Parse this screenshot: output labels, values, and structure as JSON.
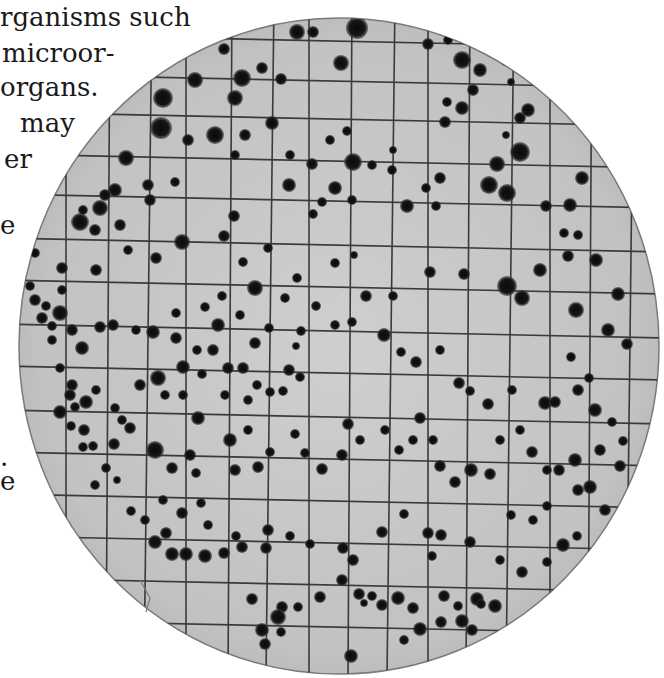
{
  "text_fragments": [
    {
      "text": "rganisms such",
      "x": 0,
      "y": 4
    },
    {
      "text": "microor-",
      "x": 2,
      "y": 40
    },
    {
      "text": "organs.",
      "x": 0,
      "y": 74
    },
    {
      "text": "may",
      "x": 20,
      "y": 110
    },
    {
      "text": "er",
      "x": 4,
      "y": 146
    },
    {
      "text": "e",
      "x": 0,
      "y": 212
    },
    {
      "text": ".",
      "x": 0,
      "y": 444
    },
    {
      "text": "e",
      "x": 0,
      "y": 468
    }
  ],
  "plate": {
    "cx": 339,
    "cy": 346,
    "rx": 320,
    "ry": 328,
    "fill": "#c4c4c4",
    "rim": "#7a7a7a",
    "grid_color": "#3a3a3a",
    "colony_color": "#111111",
    "grid_x": [
      68,
      110,
      150,
      188,
      232,
      272,
      311,
      352,
      393,
      430,
      470,
      512,
      552,
      592,
      632
    ],
    "grid_y": [
      40,
      80,
      118,
      160,
      200,
      244,
      286,
      330,
      372,
      416,
      458,
      500,
      542,
      584,
      626
    ]
  },
  "colonies": [
    [
      357,
      28,
      11
    ],
    [
      297,
      32,
      8
    ],
    [
      313,
      32,
      6
    ],
    [
      242,
      78,
      9
    ],
    [
      341,
      63,
      8
    ],
    [
      195,
      80,
      8
    ],
    [
      235,
      98,
      8
    ],
    [
      281,
      79,
      6
    ],
    [
      272,
      123,
      7
    ],
    [
      245,
      135,
      6
    ],
    [
      215,
      135,
      9
    ],
    [
      188,
      140,
      6
    ],
    [
      235,
      155,
      5
    ],
    [
      161,
      128,
      11
    ],
    [
      163,
      98,
      10
    ],
    [
      224,
      49,
      6
    ],
    [
      262,
      68,
      6
    ],
    [
      80,
      222,
      9
    ],
    [
      100,
      208,
      8
    ],
    [
      95,
      230,
      6
    ],
    [
      115,
      190,
      7
    ],
    [
      120,
      225,
      6
    ],
    [
      126,
      158,
      8
    ],
    [
      105,
      195,
      6
    ],
    [
      150,
      200,
      6
    ],
    [
      175,
      182,
      5
    ],
    [
      148,
      185,
      6
    ],
    [
      83,
      210,
      5
    ],
    [
      428,
      44,
      6
    ],
    [
      448,
      40,
      5
    ],
    [
      477,
      35,
      8
    ],
    [
      462,
      60,
      9
    ],
    [
      480,
      70,
      7
    ],
    [
      473,
      90,
      6
    ],
    [
      447,
      102,
      5
    ],
    [
      462,
      108,
      7
    ],
    [
      445,
      122,
      6
    ],
    [
      506,
      60,
      6
    ],
    [
      511,
      82,
      4
    ],
    [
      520,
      118,
      6
    ],
    [
      520,
      152,
      10
    ],
    [
      497,
      164,
      8
    ],
    [
      507,
      193,
      9
    ],
    [
      546,
      206,
      6
    ],
    [
      582,
      178,
      7
    ],
    [
      570,
      205,
      7
    ],
    [
      578,
      235,
      5
    ],
    [
      564,
      233,
      5
    ],
    [
      489,
      185,
      9
    ],
    [
      528,
      110,
      7
    ],
    [
      506,
      135,
      4
    ],
    [
      353,
      162,
      9
    ],
    [
      347,
      131,
      5
    ],
    [
      330,
      140,
      5
    ],
    [
      312,
      164,
      6
    ],
    [
      335,
      188,
      7
    ],
    [
      352,
      200,
      5
    ],
    [
      322,
      202,
      5
    ],
    [
      372,
      165,
      5
    ],
    [
      290,
      155,
      5
    ],
    [
      289,
      185,
      7
    ],
    [
      313,
      214,
      5
    ],
    [
      407,
      206,
      7
    ],
    [
      392,
      170,
      5
    ],
    [
      393,
      150,
      4
    ],
    [
      426,
      188,
      5
    ],
    [
      440,
      178,
      6
    ],
    [
      436,
      206,
      5
    ],
    [
      234,
      216,
      6
    ],
    [
      224,
      236,
      6
    ],
    [
      243,
      262,
      5
    ],
    [
      268,
      248,
      5
    ],
    [
      182,
      242,
      8
    ],
    [
      156,
      258,
      6
    ],
    [
      128,
      250,
      5
    ],
    [
      96,
      270,
      6
    ],
    [
      62,
      268,
      6
    ],
    [
      35,
      253,
      5
    ],
    [
      255,
      288,
      8
    ],
    [
      285,
      298,
      5
    ],
    [
      297,
      278,
      5
    ],
    [
      335,
      263,
      5
    ],
    [
      354,
      255,
      4
    ],
    [
      366,
      296,
      6
    ],
    [
      393,
      296,
      5
    ],
    [
      430,
      272,
      6
    ],
    [
      464,
      274,
      6
    ],
    [
      507,
      286,
      10
    ],
    [
      522,
      298,
      8
    ],
    [
      540,
      270,
      7
    ],
    [
      568,
      256,
      6
    ],
    [
      596,
      260,
      7
    ],
    [
      576,
      310,
      8
    ],
    [
      608,
      330,
      7
    ],
    [
      618,
      294,
      7
    ],
    [
      627,
      344,
      6
    ],
    [
      62,
      290,
      5
    ],
    [
      60,
      313,
      8
    ],
    [
      72,
      330,
      6
    ],
    [
      52,
      340,
      5
    ],
    [
      82,
      348,
      7
    ],
    [
      100,
      327,
      6
    ],
    [
      113,
      325,
      6
    ],
    [
      136,
      330,
      5
    ],
    [
      153,
      332,
      7
    ],
    [
      176,
      313,
      5
    ],
    [
      176,
      338,
      6
    ],
    [
      218,
      325,
      7
    ],
    [
      240,
      315,
      5
    ],
    [
      255,
      343,
      6
    ],
    [
      269,
      328,
      5
    ],
    [
      296,
      346,
      4
    ],
    [
      301,
      331,
      5
    ],
    [
      316,
      306,
      5
    ],
    [
      335,
      325,
      5
    ],
    [
      352,
      322,
      5
    ],
    [
      205,
      307,
      5
    ],
    [
      222,
      296,
      5
    ],
    [
      213,
      350,
      6
    ],
    [
      197,
      350,
      5
    ],
    [
      183,
      367,
      7
    ],
    [
      202,
      374,
      5
    ],
    [
      228,
      368,
      6
    ],
    [
      243,
      368,
      6
    ],
    [
      257,
      385,
      5
    ],
    [
      248,
      400,
      5
    ],
    [
      270,
      392,
      5
    ],
    [
      283,
      391,
      5
    ],
    [
      289,
      370,
      6
    ],
    [
      300,
      377,
      5
    ],
    [
      384,
      335,
      7
    ],
    [
      401,
      352,
      5
    ],
    [
      416,
      362,
      6
    ],
    [
      440,
      350,
      5
    ],
    [
      459,
      383,
      6
    ],
    [
      470,
      391,
      5
    ],
    [
      488,
      404,
      6
    ],
    [
      512,
      390,
      5
    ],
    [
      545,
      403,
      7
    ],
    [
      555,
      402,
      6
    ],
    [
      578,
      390,
      6
    ],
    [
      595,
      410,
      7
    ],
    [
      589,
      378,
      5
    ],
    [
      571,
      357,
      5
    ],
    [
      60,
      368,
      5
    ],
    [
      70,
      395,
      6
    ],
    [
      60,
      412,
      7
    ],
    [
      86,
      402,
      7
    ],
    [
      96,
      390,
      5
    ],
    [
      115,
      408,
      5
    ],
    [
      122,
      420,
      5
    ],
    [
      140,
      385,
      6
    ],
    [
      158,
      378,
      8
    ],
    [
      165,
      395,
      5
    ],
    [
      183,
      395,
      5
    ],
    [
      198,
      418,
      7
    ],
    [
      225,
      395,
      5
    ],
    [
      230,
      440,
      7
    ],
    [
      248,
      430,
      5
    ],
    [
      84,
      430,
      6
    ],
    [
      93,
      446,
      5
    ],
    [
      114,
      444,
      6
    ],
    [
      130,
      428,
      6
    ],
    [
      155,
      450,
      9
    ],
    [
      172,
      468,
      6
    ],
    [
      190,
      455,
      6
    ],
    [
      196,
      473,
      5
    ],
    [
      235,
      470,
      6
    ],
    [
      258,
      467,
      6
    ],
    [
      270,
      452,
      5
    ],
    [
      295,
      434,
      5
    ],
    [
      305,
      453,
      5
    ],
    [
      322,
      469,
      6
    ],
    [
      342,
      455,
      6
    ],
    [
      348,
      424,
      6
    ],
    [
      360,
      440,
      5
    ],
    [
      385,
      430,
      5
    ],
    [
      399,
      450,
      5
    ],
    [
      420,
      418,
      6
    ],
    [
      413,
      440,
      5
    ],
    [
      433,
      440,
      5
    ],
    [
      440,
      466,
      6
    ],
    [
      455,
      482,
      6
    ],
    [
      471,
      470,
      7
    ],
    [
      490,
      474,
      6
    ],
    [
      500,
      440,
      5
    ],
    [
      520,
      430,
      5
    ],
    [
      532,
      452,
      6
    ],
    [
      547,
      470,
      5
    ],
    [
      559,
      470,
      6
    ],
    [
      575,
      460,
      7
    ],
    [
      590,
      487,
      7
    ],
    [
      600,
      450,
      6
    ],
    [
      620,
      466,
      6
    ],
    [
      623,
      441,
      5
    ],
    [
      612,
      422,
      5
    ],
    [
      155,
      542,
      7
    ],
    [
      166,
      533,
      6
    ],
    [
      172,
      554,
      7
    ],
    [
      186,
      554,
      7
    ],
    [
      205,
      556,
      7
    ],
    [
      224,
      553,
      6
    ],
    [
      242,
      547,
      6
    ],
    [
      266,
      548,
      6
    ],
    [
      236,
      536,
      5
    ],
    [
      268,
      530,
      6
    ],
    [
      290,
      536,
      5
    ],
    [
      310,
      544,
      5
    ],
    [
      343,
      548,
      6
    ],
    [
      353,
      560,
      6
    ],
    [
      382,
      532,
      6
    ],
    [
      404,
      514,
      5
    ],
    [
      428,
      533,
      6
    ],
    [
      441,
      535,
      6
    ],
    [
      432,
      556,
      5
    ],
    [
      470,
      542,
      6
    ],
    [
      252,
      599,
      6
    ],
    [
      282,
      607,
      6
    ],
    [
      278,
      617,
      8
    ],
    [
      262,
      630,
      7
    ],
    [
      265,
      644,
      6
    ],
    [
      281,
      632,
      5
    ],
    [
      298,
      607,
      5
    ],
    [
      320,
      597,
      6
    ],
    [
      342,
      580,
      6
    ],
    [
      359,
      594,
      6
    ],
    [
      372,
      596,
      5
    ],
    [
      382,
      605,
      6
    ],
    [
      398,
      598,
      7
    ],
    [
      413,
      608,
      6
    ],
    [
      404,
      640,
      5
    ],
    [
      420,
      629,
      7
    ],
    [
      444,
      596,
      6
    ],
    [
      441,
      622,
      6
    ],
    [
      458,
      606,
      5
    ],
    [
      462,
      621,
      7
    ],
    [
      472,
      630,
      6
    ],
    [
      477,
      599,
      7
    ],
    [
      481,
      604,
      5
    ],
    [
      495,
      606,
      7
    ],
    [
      351,
      656,
      7
    ],
    [
      364,
      603,
      4
    ],
    [
      500,
      560,
      5
    ],
    [
      522,
      572,
      6
    ],
    [
      547,
      562,
      5
    ],
    [
      563,
      545,
      7
    ],
    [
      577,
      536,
      5
    ],
    [
      578,
      490,
      6
    ],
    [
      547,
      506,
      5
    ],
    [
      533,
      520,
      5
    ],
    [
      511,
      515,
      5
    ],
    [
      605,
      510,
      6
    ],
    [
      612,
      555,
      6
    ],
    [
      622,
      520,
      5
    ],
    [
      35,
      300,
      6
    ],
    [
      46,
      306,
      5
    ],
    [
      42,
      318,
      6
    ],
    [
      30,
      286,
      5
    ],
    [
      52,
      326,
      5
    ],
    [
      72,
      385,
      6
    ],
    [
      75,
      407,
      5
    ],
    [
      71,
      426,
      5
    ],
    [
      83,
      447,
      5
    ],
    [
      106,
      468,
      5
    ],
    [
      95,
      485,
      5
    ],
    [
      117,
      480,
      4
    ],
    [
      131,
      511,
      5
    ],
    [
      145,
      520,
      5
    ],
    [
      163,
      500,
      5
    ],
    [
      182,
      513,
      6
    ],
    [
      201,
      503,
      5
    ],
    [
      208,
      525,
      5
    ]
  ]
}
